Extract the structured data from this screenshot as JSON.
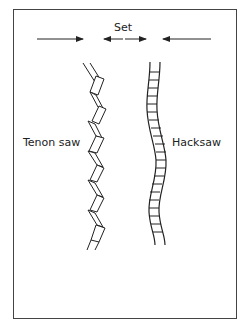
{
  "diagram": {
    "set_label": "Set",
    "left_label": "Tenon saw",
    "right_label": "Hacksaw",
    "colors": {
      "stroke": "#222222",
      "frame": "#444444",
      "background": "#ffffff"
    }
  }
}
